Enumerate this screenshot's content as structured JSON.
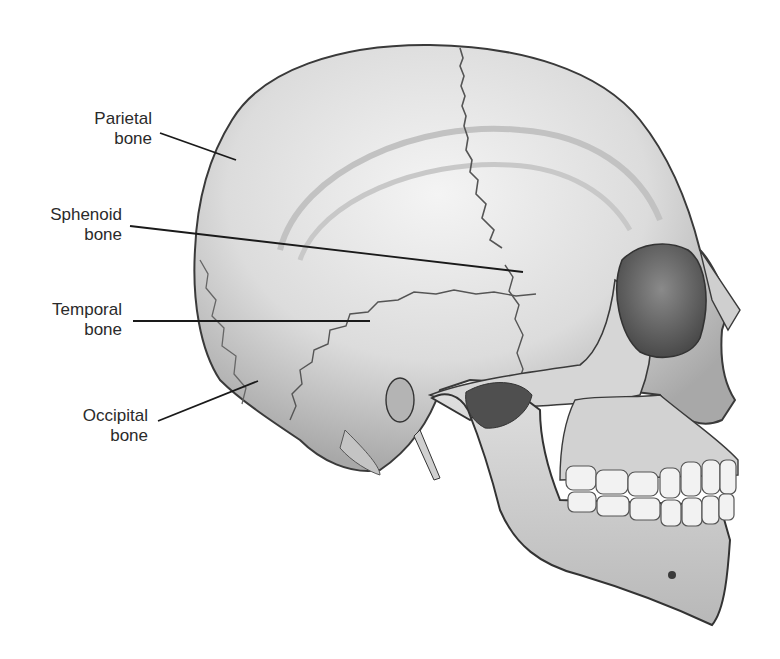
{
  "figure": {
    "background_color": "#ffffff",
    "bone_color": "#e4e4e4",
    "shadow_color": "#9a9a9a",
    "outline_color": "#3a3a3a",
    "leader_color": "#1a1a1a"
  },
  "labels": [
    {
      "line1": "Parietal",
      "line2": "bone",
      "target": "parietal"
    },
    {
      "line1": "Sphenoid",
      "line2": "bone",
      "target": "sphenoid"
    },
    {
      "line1": "Temporal",
      "line2": "bone",
      "target": "temporal"
    },
    {
      "line1": "Occipital",
      "line2": "bone",
      "target": "occipital"
    }
  ]
}
